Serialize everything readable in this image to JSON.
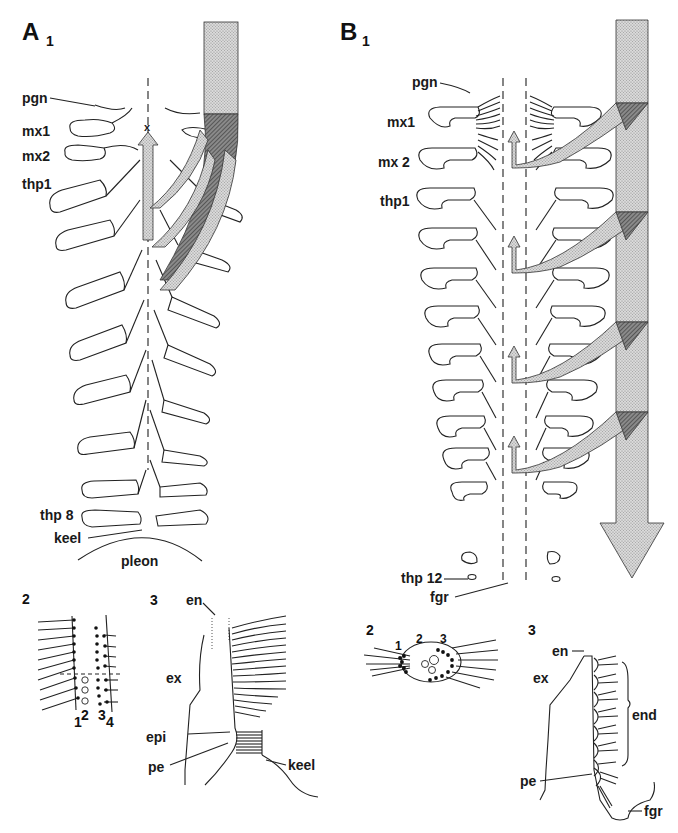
{
  "figure": {
    "panels": {
      "A": {
        "letter": "A",
        "sub": "1"
      },
      "B": {
        "letter": "B",
        "sub": "1"
      }
    },
    "labels_A1": {
      "pgn": "pgn",
      "mx1": "mx1",
      "mx2": "mx2",
      "thp1": "thp1",
      "thp8": "thp 8",
      "keel": "keel",
      "pleon": "pleon",
      "x_marker": "x"
    },
    "labels_B1": {
      "pgn": "pgn",
      "mx1": "mx1",
      "mx2": "mx 2",
      "thp1": "thp1",
      "thp12": "thp 12",
      "fgr": "fgr"
    },
    "A2": {
      "num": "2",
      "rows": [
        "1",
        "2",
        "3",
        "4"
      ]
    },
    "A3": {
      "num": "3",
      "en": "en",
      "ex": "ex",
      "epi": "epi",
      "pe": "pe",
      "keel": "keel"
    },
    "B2": {
      "num": "2",
      "groups": [
        "1",
        "2",
        "3"
      ]
    },
    "B3": {
      "num": "3",
      "en": "en",
      "ex": "ex",
      "end": "end",
      "pe": "pe",
      "fgr": "fgr"
    }
  }
}
